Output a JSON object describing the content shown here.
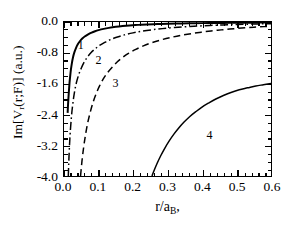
{
  "chart_data": {
    "type": "line",
    "title": "",
    "xlabel": "r/a_B,",
    "ylabel": "Im[V_r(r;F)] (a.u.)",
    "xlim": [
      0.0,
      0.6
    ],
    "ylim": [
      -4.0,
      0.0
    ],
    "grid": false,
    "legend": "inline-curve-labels",
    "xticks": [
      "0.0",
      "0.1",
      "0.2",
      "0.3",
      "0.4",
      "0.5",
      "0.6"
    ],
    "xtick_values": [
      0.0,
      0.1,
      0.2,
      0.3,
      0.4,
      0.5,
      0.6
    ],
    "yticks": [
      "0.0",
      "-0.8",
      "-1.6",
      "-2.4",
      "-3.2",
      "-4.0"
    ],
    "ytick_values": [
      0.0,
      -0.8,
      -1.6,
      -2.4,
      -3.2,
      -4.0
    ],
    "x_minor_per_major": 5,
    "y_minor_per_major": 4,
    "series": [
      {
        "name": "1",
        "label": "1",
        "style": "solid",
        "color": "#000000",
        "width": 2.0,
        "label_position": {
          "x": 0.042,
          "y": -0.62
        },
        "points": [
          [
            0.0105,
            -2.36
          ],
          [
            0.012,
            -2.1
          ],
          [
            0.014,
            -1.82
          ],
          [
            0.016,
            -1.58
          ],
          [
            0.018,
            -1.4
          ],
          [
            0.02,
            -1.24
          ],
          [
            0.023,
            -1.06
          ],
          [
            0.026,
            -0.92
          ],
          [
            0.03,
            -0.79
          ],
          [
            0.035,
            -0.67
          ],
          [
            0.04,
            -0.58
          ],
          [
            0.046,
            -0.5
          ],
          [
            0.053,
            -0.43
          ],
          [
            0.06,
            -0.375
          ],
          [
            0.07,
            -0.32
          ],
          [
            0.08,
            -0.275
          ],
          [
            0.09,
            -0.24
          ],
          [
            0.1,
            -0.212
          ],
          [
            0.115,
            -0.178
          ],
          [
            0.13,
            -0.152
          ],
          [
            0.15,
            -0.125
          ],
          [
            0.17,
            -0.105
          ],
          [
            0.19,
            -0.09
          ],
          [
            0.215,
            -0.075
          ],
          [
            0.24,
            -0.064
          ],
          [
            0.27,
            -0.054
          ],
          [
            0.3,
            -0.046
          ],
          [
            0.34,
            -0.038
          ],
          [
            0.38,
            -0.032
          ],
          [
            0.42,
            -0.027
          ],
          [
            0.46,
            -0.023
          ],
          [
            0.5,
            -0.02
          ],
          [
            0.54,
            -0.017
          ],
          [
            0.58,
            -0.015
          ],
          [
            0.6,
            -0.014
          ]
        ]
      },
      {
        "name": "2",
        "label": "2",
        "style": "dashdot",
        "color": "#000000",
        "width": 1.5,
        "label_position": {
          "x": 0.093,
          "y": -1.0
        },
        "points": [
          [
            0.0125,
            -4.0
          ],
          [
            0.014,
            -3.6
          ],
          [
            0.016,
            -3.2
          ],
          [
            0.018,
            -2.88
          ],
          [
            0.021,
            -2.52
          ],
          [
            0.024,
            -2.24
          ],
          [
            0.028,
            -1.96
          ],
          [
            0.032,
            -1.74
          ],
          [
            0.037,
            -1.54
          ],
          [
            0.043,
            -1.36
          ],
          [
            0.05,
            -1.2
          ],
          [
            0.058,
            -1.05
          ],
          [
            0.067,
            -0.92
          ],
          [
            0.078,
            -0.8
          ],
          [
            0.09,
            -0.7
          ],
          [
            0.103,
            -0.61
          ],
          [
            0.118,
            -0.53
          ],
          [
            0.135,
            -0.455
          ],
          [
            0.155,
            -0.39
          ],
          [
            0.175,
            -0.335
          ],
          [
            0.2,
            -0.283
          ],
          [
            0.225,
            -0.24
          ],
          [
            0.255,
            -0.202
          ],
          [
            0.285,
            -0.172
          ],
          [
            0.32,
            -0.144
          ],
          [
            0.36,
            -0.119
          ],
          [
            0.4,
            -0.099
          ],
          [
            0.44,
            -0.083
          ],
          [
            0.48,
            -0.07
          ],
          [
            0.52,
            -0.059
          ],
          [
            0.56,
            -0.05
          ],
          [
            0.6,
            -0.043
          ]
        ]
      },
      {
        "name": "3",
        "label": "3",
        "style": "dashed",
        "color": "#000000",
        "width": 1.5,
        "label_position": {
          "x": 0.142,
          "y": -1.6
        },
        "points": [
          [
            0.048,
            -4.0
          ],
          [
            0.052,
            -3.62
          ],
          [
            0.057,
            -3.25
          ],
          [
            0.062,
            -2.95
          ],
          [
            0.068,
            -2.65
          ],
          [
            0.075,
            -2.38
          ],
          [
            0.083,
            -2.12
          ],
          [
            0.092,
            -1.89
          ],
          [
            0.102,
            -1.68
          ],
          [
            0.113,
            -1.49
          ],
          [
            0.125,
            -1.33
          ],
          [
            0.139,
            -1.18
          ],
          [
            0.154,
            -1.04
          ],
          [
            0.17,
            -0.92
          ],
          [
            0.188,
            -0.81
          ],
          [
            0.208,
            -0.71
          ],
          [
            0.23,
            -0.62
          ],
          [
            0.255,
            -0.535
          ],
          [
            0.282,
            -0.462
          ],
          [
            0.31,
            -0.4
          ],
          [
            0.34,
            -0.345
          ],
          [
            0.375,
            -0.293
          ],
          [
            0.41,
            -0.25
          ],
          [
            0.445,
            -0.214
          ],
          [
            0.48,
            -0.184
          ],
          [
            0.515,
            -0.158
          ],
          [
            0.55,
            -0.136
          ],
          [
            0.58,
            -0.12
          ],
          [
            0.6,
            -0.11
          ]
        ]
      },
      {
        "name": "4",
        "label": "4",
        "style": "solid",
        "color": "#000000",
        "width": 1.5,
        "label_position": {
          "x": 0.412,
          "y": -2.92
        },
        "points": [
          [
            0.255,
            -4.0
          ],
          [
            0.262,
            -3.84
          ],
          [
            0.27,
            -3.67
          ],
          [
            0.28,
            -3.48
          ],
          [
            0.292,
            -3.28
          ],
          [
            0.305,
            -3.09
          ],
          [
            0.318,
            -2.92
          ],
          [
            0.332,
            -2.76
          ],
          [
            0.348,
            -2.6
          ],
          [
            0.364,
            -2.46
          ],
          [
            0.382,
            -2.33
          ],
          [
            0.4,
            -2.21
          ],
          [
            0.42,
            -2.1
          ],
          [
            0.44,
            -2.0
          ],
          [
            0.462,
            -1.91
          ],
          [
            0.484,
            -1.83
          ],
          [
            0.508,
            -1.76
          ],
          [
            0.532,
            -1.71
          ],
          [
            0.556,
            -1.66
          ],
          [
            0.578,
            -1.63
          ],
          [
            0.6,
            -1.6
          ]
        ]
      }
    ]
  },
  "axes": {
    "ylabel_html": "Im[V<sub>r</sub>(r;F)] (a.u.)",
    "xlabel_html": "r/a<sub>B</sub>,"
  }
}
